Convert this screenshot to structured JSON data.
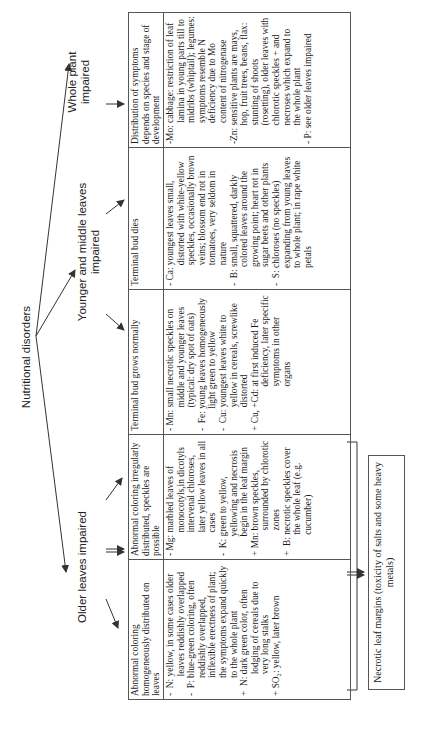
{
  "diagram": {
    "root": "Nutritional disorders",
    "branches": {
      "older": "Older leaves impaired",
      "younger": "Younger and middle leaves impaired",
      "whole": "Whole plant impaired"
    },
    "columns": [
      {
        "header": "Abnormal coloring homogeneously distributed on leaves",
        "entries": [
          {
            "prefix": "-  N:",
            "text": "yellow, in some cases older leaves reddishly overlapped"
          },
          {
            "prefix": "-  P:",
            "text": "blue-green coloring, often reddishly overlapped, inflexible erectness of plant; the symptoms expand quickly to the whole plant"
          },
          {
            "prefix": "+  N:",
            "text": "dark green color, often lodging of cereals due to very long stalks"
          },
          {
            "prefix": "+ SO₂:",
            "text": "yellow, later brown"
          }
        ]
      },
      {
        "header": "Abnormal coloring irregularly distributed, speckles are possible",
        "entries": [
          {
            "prefix": "- Mg:",
            "text": "marbled leaves of monocotyls,in dicotyls intervenal chloroses, later yellow leaves in all cases"
          },
          {
            "prefix": "-  K:",
            "text": "green to yellow, yellowing and necrosis begin in the leaf margin"
          },
          {
            "prefix": "+ Mn:",
            "text": "brown speckles, surrounded by chlorotic zones"
          },
          {
            "prefix": "+  B:",
            "text": "necrotic speckles cover the whole leaf (e.g. cucumber)"
          }
        ]
      },
      {
        "header": "Terminal bud grows normally",
        "entries": [
          {
            "prefix": "- Mn:",
            "text": "small necrotic speckles on middle and younger leaves (typical: dry spot of oats)"
          },
          {
            "prefix": "-  Fe:",
            "text": "young leaves homogeneously light green to yellow"
          },
          {
            "prefix": "-  Cu:",
            "text": "youngest leaves white to yellow in cereals, screwlike distorted"
          },
          {
            "prefix": "+ Cu, +Cd:",
            "text": "at first induced Fe deficiency, later specific symptoms in other organs"
          }
        ]
      },
      {
        "header": "Terminal bud dies",
        "entries": [
          {
            "prefix": "- Ca:",
            "text": "youngest leaves small, distorted with white-yellow speckles, occasionally brown veins; blossom end rot in tomatoes, very seldom in nature"
          },
          {
            "prefix": "-  B:",
            "text": "small, squattered, darkly colored leaves around the growing point; heart rot in sugar beets and other plants"
          },
          {
            "prefix": "-  S:",
            "text": "chloroses (no speckles) expanding from young leaves to whole plant; in rape white petals"
          }
        ]
      },
      {
        "header": "Distribution of symptoms depends on species and stage of development",
        "entries": [
          {
            "prefix": "-Mo:",
            "text": "cabbage: restriction of leaf lamina in young parts till to midribs (whiptail); legumes: symptoms resemble N deficiency due to Mo content of nitrogenase"
          },
          {
            "prefix": "-Zn:",
            "text": "sensitive plants are mays, hop, fruit trees, beans, flax: stunting of shoots (rosetting), older leaves with chlorotic speckles + and necroses which expand to the whole plant"
          },
          {
            "prefix": "- P:",
            "text": "see older leaves impaired"
          }
        ]
      }
    ],
    "bottom_box": "Necrotic leaf margins (toxicity of salts and some heavy metals)"
  },
  "colors": {
    "line": "#333333",
    "border": "#555555",
    "text": "#1a1a1a",
    "background": "#ffffff"
  }
}
